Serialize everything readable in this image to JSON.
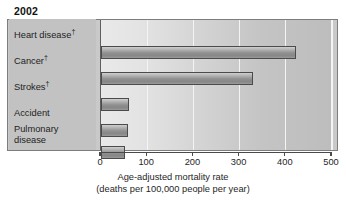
{
  "chart_data": {
    "type": "bar",
    "orientation": "horizontal",
    "title": "2002",
    "xlabel_line1": "Age-adjusted mortality rate",
    "xlabel_line2": "(deaths per 100,000 people per year)",
    "ylabel": "",
    "categories": [
      "Heart disease†",
      "Cancer†",
      "Strokes†",
      "Accident",
      "Pulmonary disease"
    ],
    "values": [
      422,
      330,
      61,
      59,
      52
    ],
    "xlim": [
      0,
      500
    ],
    "xticks": [
      0,
      100,
      200,
      300,
      400,
      500
    ],
    "xtick_labels": [
      "0",
      "100",
      "200",
      "300",
      "400",
      "500"
    ],
    "grid": true,
    "grid_axis": "x",
    "legend": "none",
    "bar_color": "#8f8f8f",
    "bar_edge_color": "#4b4b4b",
    "plot_background": "#d5d5d5",
    "panel_background": "#c9c9c9"
  },
  "chart": {
    "title": "2002",
    "rows": [
      {
        "label_line1": "Heart disease",
        "dagger": "†",
        "label_line2": "",
        "value": 422
      },
      {
        "label_line1": "Cancer",
        "dagger": "†",
        "label_line2": "",
        "value": 330
      },
      {
        "label_line1": "Strokes",
        "dagger": "†",
        "label_line2": "",
        "value": 61
      },
      {
        "label_line1": "Accident",
        "dagger": "",
        "label_line2": "",
        "value": 59
      },
      {
        "label_line1": "Pulmonary",
        "dagger": "",
        "label_line2": "disease",
        "value": 52
      }
    ],
    "axis": {
      "ticks": [
        "0",
        "100",
        "200",
        "300",
        "400",
        "500"
      ],
      "title_line1": "Age-adjusted mortality rate",
      "title_line2": "(deaths per 100,000 people per year)"
    }
  }
}
